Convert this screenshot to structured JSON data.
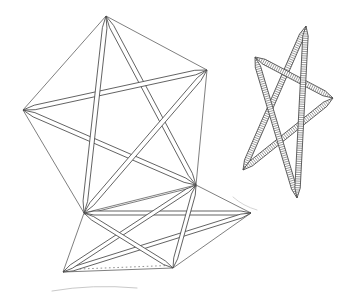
{
  "canvas": {
    "width": 355,
    "height": 295
  },
  "style": {
    "paper": "#ffffff",
    "ink": "#474747",
    "artifact_color": "#c9c9c9",
    "thin_width": 0.7,
    "strip_outline_width": 0.85,
    "dash_width": 0.6,
    "dash_pattern": "1.6 2.6",
    "hatch_width": 0.55
  },
  "figures": [
    {
      "id": "pentagram-large",
      "description": "large pentagram of flat strips inscribed in a thin-line pentagon",
      "strip_halfwidth": 2.3,
      "taper": 12,
      "hatched": false,
      "thin_lines": [
        [
          106,
          16,
          207,
          70
        ],
        [
          207,
          70,
          196,
          185
        ],
        [
          196,
          185,
          84,
          213
        ],
        [
          84,
          213,
          23,
          110
        ],
        [
          23,
          110,
          106,
          16
        ]
      ],
      "strips": [
        [
          106,
          16,
          196,
          185
        ],
        [
          196,
          185,
          23,
          110
        ],
        [
          23,
          110,
          207,
          70
        ],
        [
          207,
          70,
          84,
          213
        ],
        [
          84,
          213,
          106,
          16
        ]
      ]
    },
    {
      "id": "pentagram-flat",
      "description": "foreshortened pentagram of strips hinged along the lower-right edge of the large pentagon",
      "strip_halfwidth": 2.0,
      "taper": 10,
      "hatched": false,
      "thin_lines": [
        [
          196,
          185,
          251,
          213
        ],
        [
          251,
          213,
          173,
          268
        ],
        [
          173,
          268,
          63,
          272
        ],
        [
          63,
          272,
          84,
          213
        ],
        [
          84.5,
          214.5,
          196.5,
          186.5
        ]
      ],
      "dashed_lines": [
        [
          67,
          269.5,
          168,
          265.5
        ]
      ],
      "strips": [
        [
          84,
          213,
          251,
          213
        ],
        [
          251,
          213,
          63,
          272
        ],
        [
          63,
          272,
          196,
          185
        ],
        [
          196,
          185,
          173,
          268
        ],
        [
          173,
          268,
          84,
          213
        ]
      ]
    },
    {
      "id": "pentagram-hatched",
      "description": "tilted five-pointed star of strips filled with cross hatching",
      "strip_halfwidth": 2.7,
      "taper": 10,
      "hatched": true,
      "hatch_spacing": 2.2,
      "thin_lines": [],
      "strips": [
        [
          306,
          26,
          243,
          170
        ],
        [
          243,
          170,
          333,
          98
        ],
        [
          333,
          98,
          255,
          57
        ],
        [
          255,
          57,
          297,
          198
        ],
        [
          297,
          198,
          306,
          26
        ]
      ]
    }
  ],
  "artifacts": [
    {
      "id": "page-curve-bottom-left",
      "path": "M 52,291 Q 92,284 137,288",
      "width": 1.0
    },
    {
      "id": "page-curve-below-star",
      "path": "M 233,197 Q 243,206 257,210",
      "width": 0.8
    }
  ]
}
